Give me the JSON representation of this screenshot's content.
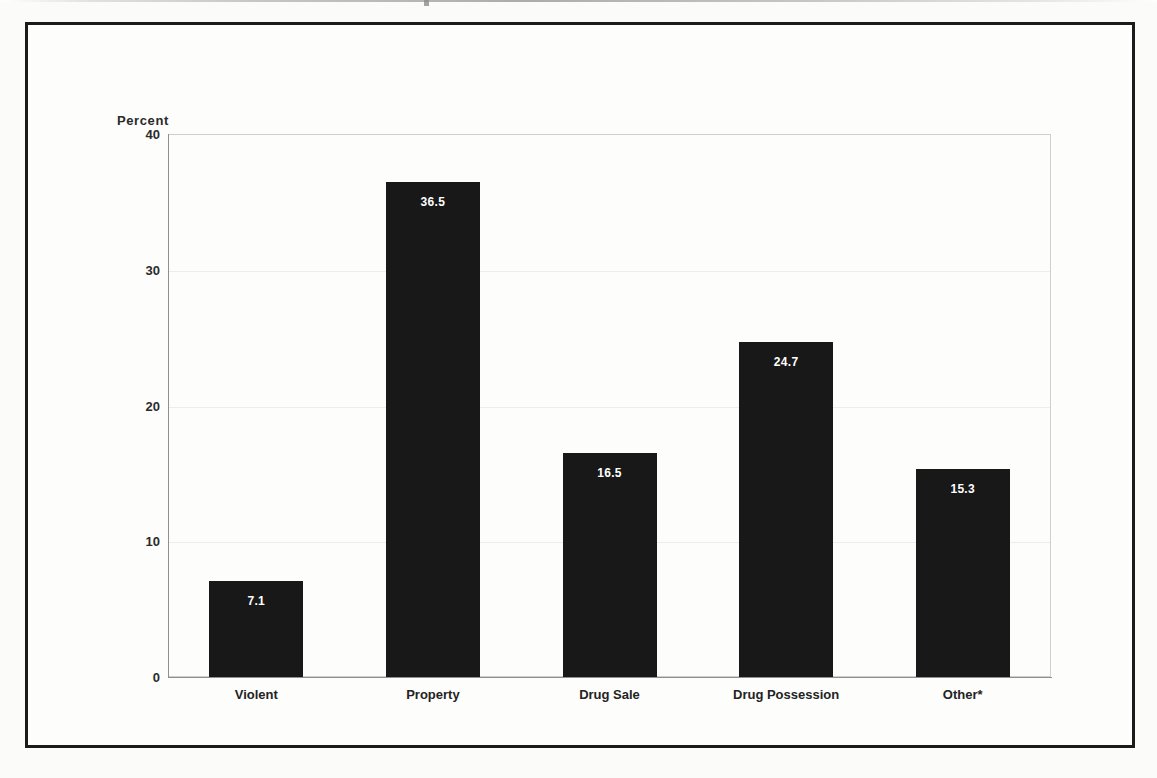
{
  "figure": {
    "axis_title_y": "Percent"
  },
  "chart_data": {
    "type": "bar",
    "title": "",
    "subtitle": "",
    "xlabel": "",
    "ylabel": "Percent",
    "ylim": [
      0,
      40
    ],
    "yticks": [
      "0",
      "10",
      "20",
      "30",
      "40"
    ],
    "ytick_values": [
      0,
      10,
      20,
      30,
      40
    ],
    "grid": true,
    "legend": "none",
    "categories": [
      "Violent",
      "Property",
      "Drug Sale",
      "Drug Possession",
      "Other*"
    ],
    "values": [
      7.1,
      36.5,
      16.5,
      24.7,
      15.3
    ],
    "value_labels": [
      "7.1",
      "36.5",
      "16.5",
      "24.7",
      "15.3"
    ],
    "bar_color": "#181818",
    "value_label_color": "#ffffff",
    "annotations": [
      "Other* category is footnoted with an asterisk"
    ]
  }
}
